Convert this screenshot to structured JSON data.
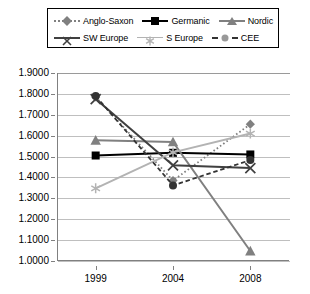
{
  "chart_data": {
    "type": "line",
    "title": "",
    "xlabel": "",
    "ylabel": "",
    "x": [
      "1999",
      "2004",
      "2008"
    ],
    "categories": [
      "1999",
      "2004",
      "2008"
    ],
    "ylim": [
      1.0,
      1.9
    ],
    "ytick_labels": [
      "1.9000",
      "1.8000",
      "1.7000",
      "1.6000",
      "1.5000",
      "1.4000",
      "1.3000",
      "1.2000",
      "1.1000",
      "1.0000"
    ],
    "ytick_values": [
      1.9,
      1.8,
      1.7,
      1.6,
      1.5,
      1.4,
      1.3,
      1.2,
      1.1,
      1.0
    ],
    "grid": true,
    "legend_position": "top",
    "series": [
      {
        "name": "Anglo-Saxon",
        "values": [
          1.785,
          1.385,
          1.655
        ],
        "color": "#808080",
        "line": "dotted",
        "marker": "diamond"
      },
      {
        "name": "Germanic",
        "values": [
          1.505,
          1.518,
          1.51
        ],
        "color": "#000000",
        "line": "solid",
        "marker": "square"
      },
      {
        "name": "Nordic",
        "values": [
          1.578,
          1.57,
          1.048
        ],
        "color": "#808080",
        "line": "solid",
        "marker": "triangle"
      },
      {
        "name": "SW Europe",
        "values": [
          1.775,
          1.458,
          1.445
        ],
        "color": "#404040",
        "line": "solid",
        "marker": "x"
      },
      {
        "name": "S Europe",
        "values": [
          1.348,
          1.52,
          1.61
        ],
        "color": "#b3b3b3",
        "line": "solid",
        "marker": "star"
      },
      {
        "name": "CEE",
        "values": [
          1.79,
          1.362,
          1.483
        ],
        "color": "#333333",
        "line": "dashed",
        "marker": "circle"
      }
    ]
  },
  "legend": {
    "rows": [
      [
        "Anglo-Saxon",
        "Germanic",
        "Nordic"
      ],
      [
        "SW Europe",
        "S Europe",
        "CEE"
      ]
    ]
  }
}
